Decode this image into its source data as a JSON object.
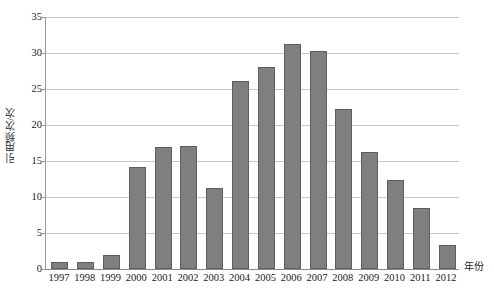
{
  "chart_data": {
    "type": "bar",
    "title": "",
    "xlabel": "年份",
    "ylabel": "引用频次/次",
    "categories": [
      "1997",
      "1998",
      "1999",
      "2000",
      "2001",
      "2002",
      "2003",
      "2004",
      "2005",
      "2006",
      "2007",
      "2008",
      "2009",
      "2010",
      "2011",
      "2012"
    ],
    "values": [
      1.0,
      1.0,
      2.0,
      14.2,
      17.0,
      17.1,
      11.2,
      26.1,
      28.1,
      31.2,
      30.3,
      22.2,
      16.3,
      12.3,
      8.5,
      3.4
    ],
    "ylim": [
      0,
      35
    ],
    "ytick_labels": [
      "0",
      "5",
      "10",
      "15",
      "20",
      "25",
      "30",
      "35"
    ],
    "ytick_values": [
      0,
      5,
      10,
      15,
      20,
      25,
      30,
      35
    ],
    "grid": true,
    "legend": "none",
    "series_color": "#7f7f7f",
    "series_border_color": "#5e5e5e",
    "gridline_color": "#c9c9c9",
    "axis_color": "#8c8c8c"
  }
}
